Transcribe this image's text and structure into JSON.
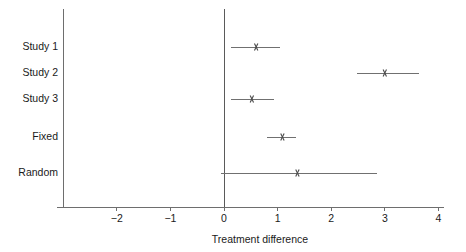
{
  "chart_data": {
    "type": "forest",
    "title": "",
    "xlabel": "Treatment difference",
    "ylabel": "",
    "xlim": [
      -2.9,
      4.15
    ],
    "xticks": [
      -2,
      -1,
      0,
      1,
      2,
      3,
      4
    ],
    "xticklabels": [
      "−2",
      "−1",
      "0",
      "1",
      "2",
      "3",
      "4"
    ],
    "grid": false,
    "legend": "none",
    "null_line": 0,
    "rows": [
      {
        "label": "Study 1",
        "estimate": 0.6,
        "ci_low": 0.13,
        "ci_high": 1.05,
        "marker": "x",
        "y": 47
      },
      {
        "label": "Study 2",
        "estimate": 3.0,
        "ci_low": 2.48,
        "ci_high": 3.63,
        "marker": "x",
        "y": 73
      },
      {
        "label": "Study 3",
        "estimate": 0.52,
        "ci_low": 0.13,
        "ci_high": 0.93,
        "marker": "x",
        "y": 99
      },
      {
        "label": "Fixed",
        "estimate": 1.09,
        "ci_low": 0.81,
        "ci_high": 1.35,
        "marker": "x",
        "y": 137
      },
      {
        "label": "Random",
        "estimate": 1.37,
        "ci_low": -0.05,
        "ci_high": 2.85,
        "marker": "x",
        "y": 173
      }
    ],
    "colors": {
      "axis": "#6e6e6e",
      "null_line": "#5a5a5a",
      "ci_line": "#707070",
      "marker": "#4a4a4a",
      "text": "#1a1a1a",
      "background": "#ffffff"
    }
  },
  "geometry": {
    "x_origin_px": 224,
    "px_per_unit": 53.6,
    "axis_y_px": 207,
    "y_axis_x_px": 63,
    "y_axis_top_px": 9,
    "axis_left_px": 57,
    "axis_right_px": 444,
    "label_right_px": 58,
    "tick_len_px": 4,
    "tick_label_y_px": 219,
    "axis_title_y_px": 240,
    "axis_title_x_px": 260,
    "marker_size_px": 3.4
  }
}
